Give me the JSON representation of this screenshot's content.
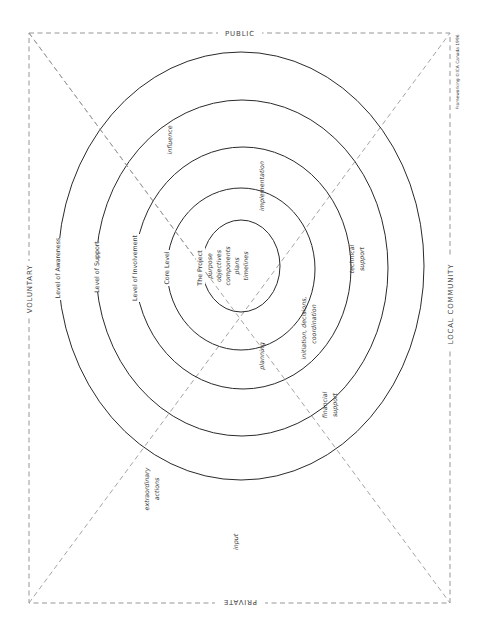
{
  "diagram": {
    "edges": {
      "top": "PUBLIC",
      "bottom": "PRIVATE",
      "left": "VOLUNTARY",
      "right": "LOCAL COMMUNITY"
    },
    "credit": "Frameworking ©ICA Canada 1996",
    "rings": [
      {
        "label": "The Project"
      },
      {
        "label": "Core Level"
      },
      {
        "label": "Level of Involvement"
      },
      {
        "label": "Level of Support"
      },
      {
        "label": "Level of Awareness"
      }
    ],
    "center_items": [
      "purpose",
      "objectives",
      "components",
      "plans",
      "timelines"
    ],
    "areas": {
      "influence": "influence",
      "implementation": "implementation",
      "technical_support_1": "technical",
      "technical_support_2": "support",
      "initiation_1": "initiation, decisions,",
      "initiation_2": "coordination",
      "planning": "planning",
      "financial_support_1": "financial",
      "financial_support_2": "support",
      "extraordinary_1": "extraordinary",
      "extraordinary_2": "actions",
      "input": "input"
    },
    "colors": {
      "ring_stroke": "#2a2a2a",
      "dashed_stroke": "#8a8a8a",
      "text": "#333333"
    }
  }
}
